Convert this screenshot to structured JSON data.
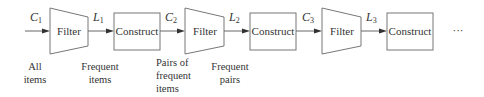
{
  "diagram": {
    "type": "flowchart",
    "stages": [
      {
        "filter_label": "Filter",
        "construct_label": "Construct"
      },
      {
        "filter_label": "Filter",
        "construct_label": "Construct"
      },
      {
        "filter_label": "Filter",
        "construct_label": "Construct"
      }
    ],
    "edges": [
      {
        "var": "C",
        "sub": "1"
      },
      {
        "var": "L",
        "sub": "1"
      },
      {
        "var": "C",
        "sub": "2"
      },
      {
        "var": "L",
        "sub": "2"
      },
      {
        "var": "C",
        "sub": "3"
      },
      {
        "var": "L",
        "sub": "3"
      }
    ],
    "continuation": "···",
    "captions": [
      {
        "lines": [
          "All",
          "items"
        ]
      },
      {
        "lines": [
          "Frequent",
          "items"
        ]
      },
      {
        "lines": [
          "Pairs of",
          "frequent",
          "items"
        ]
      },
      {
        "lines": [
          "Frequent",
          "pairs"
        ]
      }
    ],
    "colors": {
      "stroke": "#777777",
      "text": "#333333",
      "background": "#ffffff"
    }
  }
}
